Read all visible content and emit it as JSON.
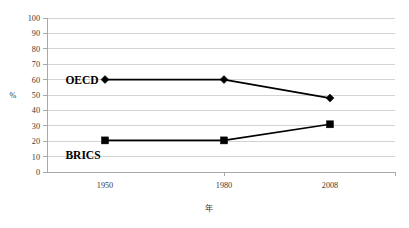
{
  "chart_data": {
    "type": "line",
    "title": "",
    "xlabel": "年",
    "ylabel": "%",
    "x": [
      1950,
      1980,
      2008
    ],
    "categories": [
      "1950",
      "1980",
      "2008"
    ],
    "xtick_labels": [
      "1950",
      "1980",
      "2008"
    ],
    "ytick_labels": [
      "0",
      "10",
      "20",
      "30",
      "40",
      "50",
      "60",
      "70",
      "80",
      "90",
      "100"
    ],
    "ytick_values": [
      0,
      10,
      20,
      30,
      40,
      50,
      60,
      70,
      80,
      90,
      100
    ],
    "ylim": [
      0,
      100
    ],
    "grid": true,
    "grid_axis": "y",
    "legend_position": "inline-annotations",
    "series": [
      {
        "name": "OECD",
        "label": "OECD",
        "marker": "diamond",
        "color": "#000000",
        "values": [
          60,
          60,
          48
        ]
      },
      {
        "name": "BRICS",
        "label": "BRICS",
        "marker": "square",
        "color": "#000000",
        "values": [
          20.5,
          20.5,
          31
        ]
      }
    ],
    "annotations": [
      {
        "text": "OECD",
        "series": "OECD",
        "x": 1950,
        "y": 60
      },
      {
        "text": "BRICS",
        "series": "BRICS",
        "x": 1950,
        "y": 11
      }
    ],
    "colors": {
      "background": "#ffffff",
      "gridline": "#c8c8c8",
      "axis": "#a0a0a0",
      "data": "#000000",
      "tick_text": "#3a3a3a"
    }
  }
}
